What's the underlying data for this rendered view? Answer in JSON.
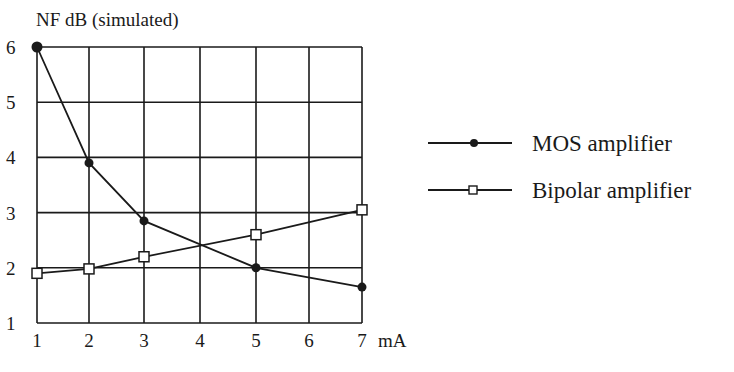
{
  "chart_data": {
    "type": "line",
    "title": "NF dB (simulated)",
    "xlabel": "mA",
    "ylabel": "NF dB (simulated)",
    "x_ticks": [
      1,
      2,
      3,
      4,
      5,
      6,
      7
    ],
    "y_ticks": [
      1,
      2,
      3,
      4,
      5,
      6
    ],
    "x_tick_labels": [
      "1",
      "2",
      "3",
      "4",
      "5",
      "6",
      "7"
    ],
    "y_tick_labels": [
      "1",
      "2",
      "3",
      "4",
      "5",
      "6"
    ],
    "xlim": [
      1,
      7
    ],
    "ylim": [
      1,
      6
    ],
    "grid": true,
    "legend_position": "right",
    "series": [
      {
        "name": "MOS amplifier",
        "marker": "filled-circle",
        "x": [
          1,
          2,
          3,
          5,
          7
        ],
        "values": [
          6.0,
          3.9,
          2.85,
          2.0,
          1.65
        ]
      },
      {
        "name": "Bipolar amplifier",
        "marker": "open-square",
        "x": [
          1,
          2,
          3,
          5,
          7
        ],
        "values": [
          1.9,
          1.98,
          2.2,
          2.6,
          3.05
        ]
      }
    ]
  },
  "colors": {
    "ink": "#1a1a1a",
    "background": "#ffffff"
  }
}
